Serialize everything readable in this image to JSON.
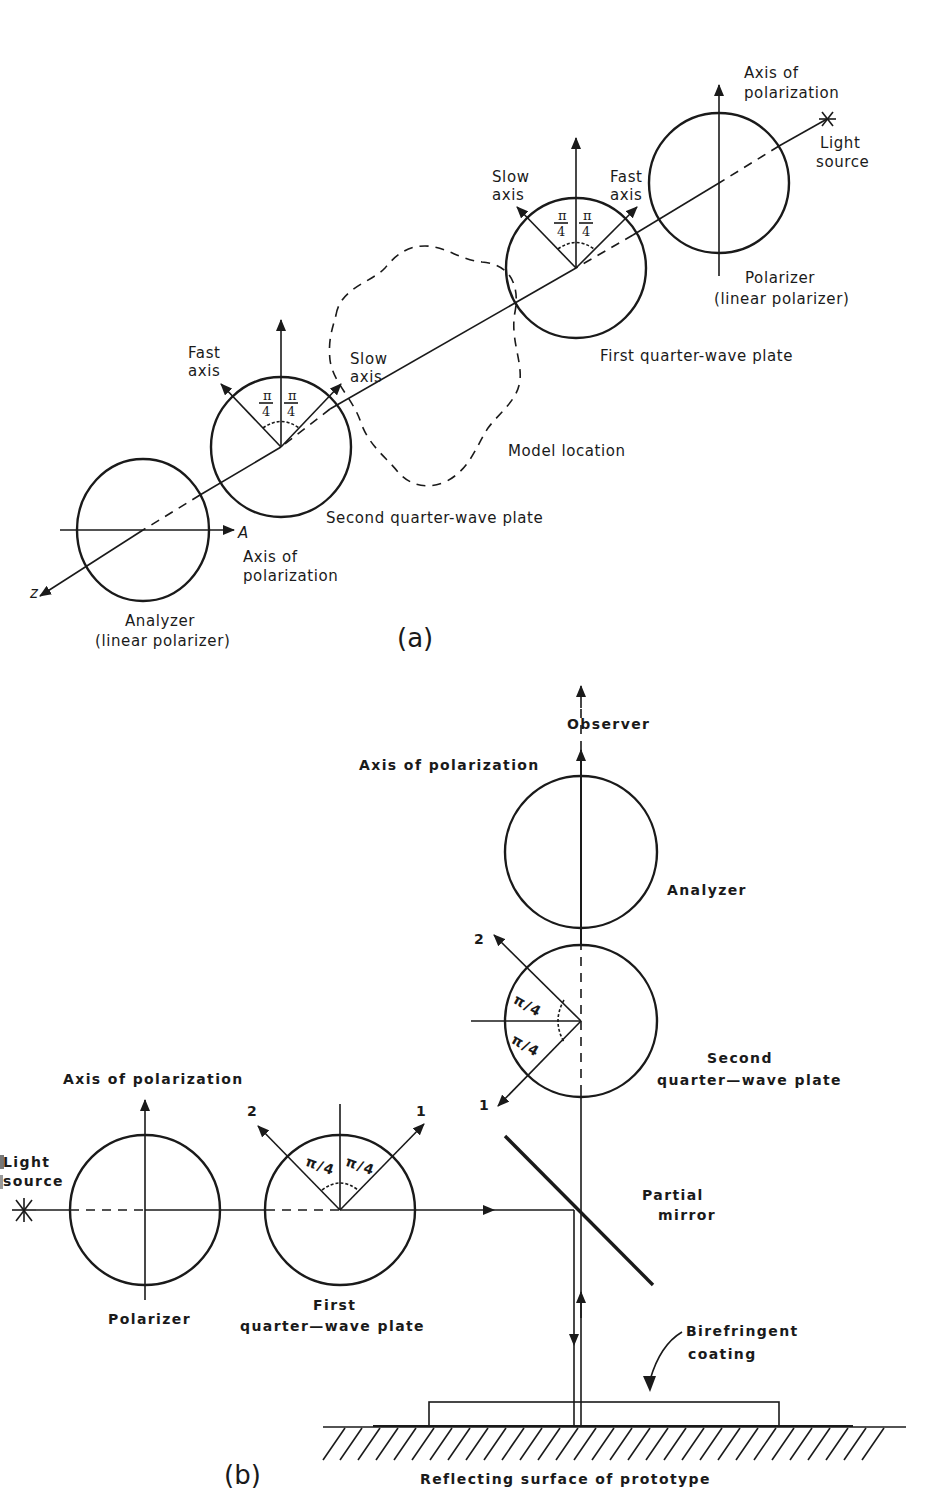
{
  "figure": {
    "panel_a": {
      "label": "(a)",
      "light_source": {
        "line1": "Light",
        "line2": "source",
        "symbol": "asterisk-icon"
      },
      "polarizer": {
        "axis_label_line1": "Axis of",
        "axis_label_line2": "polarization",
        "name_line1": "Polarizer",
        "name_line2": "(linear polarizer)"
      },
      "first_qwp": {
        "name": "First quarter-wave plate",
        "slow_axis_line1": "Slow",
        "slow_axis_line2": "axis",
        "fast_axis_line1": "Fast",
        "fast_axis_line2": "axis",
        "angle_num": "π",
        "angle_den": "4"
      },
      "model": {
        "name": "Model location"
      },
      "second_qwp": {
        "name": "Second quarter-wave plate",
        "fast_axis_line1": "Fast",
        "fast_axis_line2": "axis",
        "slow_axis_line1": "Slow",
        "slow_axis_line2": "axis",
        "angle_num": "π",
        "angle_den": "4"
      },
      "analyzer": {
        "name_line1": "Analyzer",
        "name_line2": "(linear polarizer)",
        "axis_letter": "A",
        "axis_label_line1": "Axis of",
        "axis_label_line2": "polarization"
      },
      "z_axis_label": "z"
    },
    "panel_b": {
      "label": "(b)",
      "light_source": {
        "line1": "Light",
        "line2": "source",
        "symbol": "asterisk-icon"
      },
      "polarizer": {
        "name": "Polarizer",
        "axis_label": "Axis of polarization"
      },
      "first_qwp": {
        "name_line1": "First",
        "name_line2": "quarter—wave plate",
        "axis_1": "1",
        "axis_2": "2",
        "angle_1": "π/4",
        "angle_2": "π/4"
      },
      "partial_mirror": {
        "line1": "Partial",
        "line2": "mirror"
      },
      "second_qwp": {
        "name_line1": "Second",
        "name_line2": "quarter—wave plate",
        "axis_1": "1",
        "axis_2": "2",
        "angle_1": "π/4",
        "angle_2": "π/4"
      },
      "analyzer": {
        "name": "Analyzer",
        "axis_label": "Axis of polarization"
      },
      "observer": "Observer",
      "coating": {
        "line1": "Birefringent",
        "line2": "coating"
      },
      "surface": "Reflecting surface of prototype"
    },
    "colors": {
      "ink": "#1a1a1a",
      "paper": "#ffffff"
    }
  }
}
